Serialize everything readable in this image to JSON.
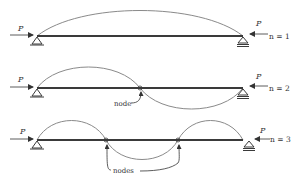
{
  "diagram": {
    "type": "column-buckling-modes",
    "colors": {
      "beam": "#3a3a3a",
      "curve": "#8a8a8a",
      "arrow": "#333333",
      "text": "#333333"
    },
    "rows": [
      {
        "id": "mode-1",
        "load_label_left": "P",
        "load_label_right": "P",
        "mode_label": "n = 1",
        "node_count": 0,
        "node_label": ""
      },
      {
        "id": "mode-2",
        "load_label_left": "P",
        "load_label_right": "P",
        "mode_label": "n = 2",
        "node_count": 1,
        "node_label": "node"
      },
      {
        "id": "mode-3",
        "load_label_left": "P",
        "load_label_right": "P",
        "mode_label": "n = 3",
        "node_count": 2,
        "node_label": "nodes"
      }
    ]
  }
}
